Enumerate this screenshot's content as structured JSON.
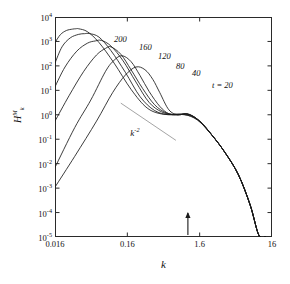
{
  "chart_data": {
    "type": "line",
    "title": "",
    "xlabel": "k",
    "ylabel_text": "H",
    "ylabel_sub": "k",
    "ylabel_sup": "M",
    "xscale": "log",
    "yscale": "log",
    "xlim": [
      0.016,
      16
    ],
    "ylim": [
      1e-05,
      10000.0
    ],
    "xticks": [
      0.016,
      0.16,
      1.6,
      16
    ],
    "xticklabels": [
      "0.016",
      "0.16",
      "1.6",
      "16"
    ],
    "yticks": [
      1e-05,
      0.0001,
      0.001,
      0.01,
      0.1,
      1,
      10,
      100,
      1000,
      10000
    ],
    "yticklabels": [
      "10<sup>-5</sup>",
      "10<sup>-4</sup>",
      "10<sup>-3</sup>",
      "10<sup>-2</sup>",
      "10<sup>-1</sup>",
      "10<sup>0</sup>",
      "10<sup>1</sup>",
      "10<sup>2</sup>",
      "10<sup>3</sup>",
      "10<sup>4</sup>"
    ],
    "grid": false,
    "legend": "inline-curve-labels",
    "annotations": [
      {
        "name": "slope-reference",
        "text": "k",
        "sup": "-2",
        "slope": -2,
        "x_from": 0.13,
        "x_to": 0.75,
        "y_at_from": 3.0
      },
      {
        "name": "x-axis-arrow-marker",
        "k": 1.1
      }
    ],
    "series": [
      {
        "name": "t = 20",
        "label": "t = 20",
        "peak_k": 0.21,
        "peak_value": 90,
        "x": [
          0.016,
          0.03,
          0.06,
          0.1,
          0.15,
          0.21,
          0.28,
          0.36,
          0.45,
          0.6,
          0.8,
          1.1,
          1.6,
          2.4,
          3.6,
          5.5,
          8.0,
          10.5,
          13.0
        ],
        "y": [
          0.0011,
          0.02,
          0.55,
          8.0,
          42,
          90,
          70,
          28,
          8.0,
          1.6,
          1.0,
          1.1,
          0.55,
          0.14,
          0.028,
          0.0035,
          0.0002,
          1.2e-05,
          1e-05
        ]
      },
      {
        "name": "t = 40",
        "label": "40",
        "peak_k": 0.135,
        "peak_value": 260,
        "x": [
          0.016,
          0.03,
          0.05,
          0.08,
          0.105,
          0.135,
          0.18,
          0.24,
          0.32,
          0.45,
          0.6,
          0.8,
          1.1,
          1.6,
          2.4,
          3.6,
          5.5,
          8.0,
          10.5,
          13.0
        ],
        "y": [
          0.007,
          0.3,
          4.0,
          60,
          170,
          260,
          150,
          40,
          9.0,
          2.2,
          1.1,
          1.0,
          1.05,
          0.55,
          0.14,
          0.028,
          0.0035,
          0.0002,
          1.2e-05,
          1e-05
        ]
      },
      {
        "name": "t = 80",
        "label": "80",
        "peak_k": 0.095,
        "peak_value": 600,
        "x": [
          0.016,
          0.025,
          0.04,
          0.06,
          0.08,
          0.095,
          0.13,
          0.18,
          0.26,
          0.38,
          0.55,
          0.8,
          1.1,
          1.6,
          2.4,
          3.6,
          5.5,
          8.0,
          10.5,
          13.0
        ],
        "y": [
          0.55,
          6.0,
          60,
          280,
          520,
          600,
          300,
          70,
          12,
          2.6,
          1.2,
          1.0,
          1.05,
          0.55,
          0.14,
          0.028,
          0.0035,
          0.0002,
          1.2e-05,
          1e-05
        ]
      },
      {
        "name": "t = 120",
        "label": "120",
        "peak_k": 0.07,
        "peak_value": 1100,
        "x": [
          0.016,
          0.022,
          0.032,
          0.045,
          0.058,
          0.07,
          0.095,
          0.14,
          0.21,
          0.32,
          0.48,
          0.72,
          1.1,
          1.6,
          2.4,
          3.6,
          5.5,
          8.0,
          10.5,
          13.0
        ],
        "y": [
          14,
          90,
          400,
          850,
          1050,
          1100,
          650,
          160,
          22,
          3.2,
          1.3,
          1.0,
          1.05,
          0.55,
          0.14,
          0.028,
          0.0035,
          0.0002,
          1.2e-05,
          1e-05
        ]
      },
      {
        "name": "t = 160",
        "label": "160",
        "peak_k": 0.048,
        "peak_value": 2100,
        "x": [
          0.016,
          0.02,
          0.026,
          0.034,
          0.041,
          0.048,
          0.065,
          0.095,
          0.15,
          0.24,
          0.38,
          0.6,
          0.95,
          1.5,
          2.4,
          3.6,
          5.5,
          8.0,
          10.5,
          13.0
        ],
        "y": [
          130,
          600,
          1400,
          1950,
          2080,
          2100,
          1500,
          420,
          55,
          5.5,
          1.5,
          1.0,
          1.05,
          0.6,
          0.14,
          0.028,
          0.0035,
          0.0002,
          1.2e-05,
          1e-05
        ]
      },
      {
        "name": "t = 200",
        "label": "200",
        "peak_k": 0.034,
        "peak_value": 3300,
        "x": [
          0.016,
          0.019,
          0.023,
          0.028,
          0.031,
          0.034,
          0.045,
          0.065,
          0.105,
          0.18,
          0.3,
          0.5,
          0.85,
          1.4,
          2.3,
          3.6,
          5.5,
          8.0,
          10.5,
          13.0
        ],
        "y": [
          900,
          1900,
          2800,
          3200,
          3300,
          3300,
          2500,
          900,
          130,
          11,
          1.9,
          1.05,
          1.05,
          0.72,
          0.16,
          0.028,
          0.0035,
          0.0002,
          1.2e-05,
          1e-05
        ]
      }
    ],
    "curve_label_positions": [
      {
        "label": "200",
        "left": 59,
        "top": 18
      },
      {
        "label": "160",
        "left": 84,
        "top": 26
      },
      {
        "label": "120",
        "left": 103,
        "top": 35
      },
      {
        "label": "80",
        "left": 121,
        "top": 45
      },
      {
        "label": "40",
        "left": 137,
        "top": 52
      },
      {
        "label": "t = 20",
        "left": 157,
        "top": 64
      }
    ],
    "colors": {
      "line": "#1a1a1a",
      "frame": "#2a2a2a",
      "slope_line": "#9a9a9a",
      "background": "#ffffff"
    }
  }
}
